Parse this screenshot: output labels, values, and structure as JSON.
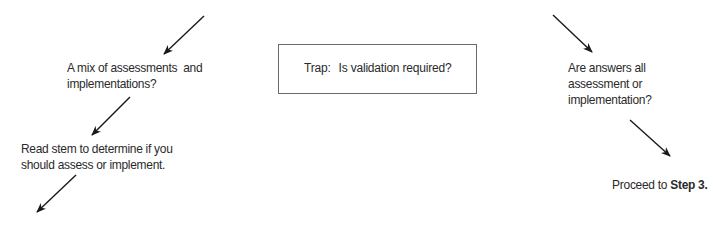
{
  "diagram": {
    "nodes": {
      "mix": {
        "line1": "A mix of assessments  and",
        "line2": "implementations?"
      },
      "read_stem": {
        "line1": "Read stem to determine if you",
        "line2": "should assess or implement."
      },
      "trap": {
        "prefix": "Trap:",
        "text": "Is validation required?"
      },
      "all_same": {
        "line1": "Are answers all",
        "line2": "assessment or",
        "line3": "implementation?"
      },
      "proceed": {
        "text": "Proceed to ",
        "bold": "Step 3."
      }
    },
    "arrows": [
      {
        "from": [
          204,
          16
        ],
        "to": [
          164,
          54
        ]
      },
      {
        "from": [
          130,
          97
        ],
        "to": [
          92,
          135
        ]
      },
      {
        "from": [
          76,
          175
        ],
        "to": [
          37,
          212
        ]
      },
      {
        "from": [
          553,
          15
        ],
        "to": [
          592,
          52
        ]
      },
      {
        "from": [
          630,
          120
        ],
        "to": [
          670,
          156
        ]
      }
    ],
    "colors": {
      "line": "#1a1a1a",
      "text": "#2a2a2a",
      "box_border": "#6a6a6a"
    }
  }
}
